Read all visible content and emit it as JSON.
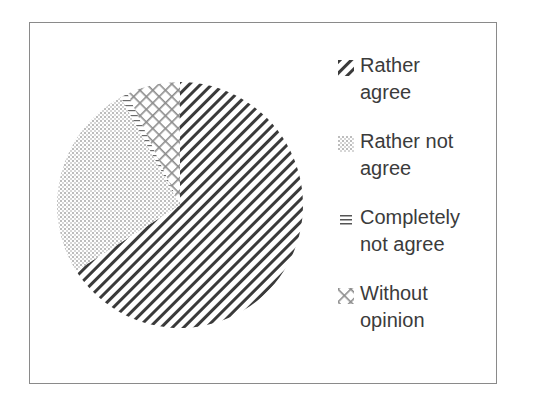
{
  "chart_data": {
    "type": "pie",
    "title": "",
    "categories": [
      "Rather agree",
      "Rather not agree",
      "Completely not agree",
      "Without opinion"
    ],
    "values": [
      66,
      26,
      1,
      7
    ],
    "unit": "%",
    "start_angle_deg": 0,
    "direction": "clockwise",
    "fills": [
      "diagonal-stripes-dark",
      "fine-dots-light",
      "horizontal-lines",
      "diagonal-crosshatch"
    ],
    "legend_position": "right",
    "grid": false
  },
  "legend": {
    "items": [
      {
        "label": "Rather\nagree",
        "icon": "diagonal-stripes-swatch-icon"
      },
      {
        "label": "Rather not\nagree",
        "icon": "dotted-swatch-icon"
      },
      {
        "label": "Completely\nnot agree",
        "icon": "horizontal-lines-swatch-icon"
      },
      {
        "label": "Without\nopinion",
        "icon": "crosshatch-swatch-icon"
      }
    ]
  },
  "colors": {
    "stripe": "#3a3a3a",
    "dots": "#b5b5b5",
    "crosshatch": "#8c8c8c",
    "border": "#8a8a8a",
    "text": "#3b3b3b"
  }
}
